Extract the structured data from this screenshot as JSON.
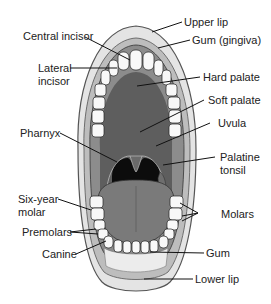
{
  "labels": {
    "upper_lip": "Upper lip",
    "gum_gingiva": "Gum (gingiva)",
    "central_incisor": "Central incisor",
    "lateral_incisor_1": "Lateral",
    "lateral_incisor_2": "incisor",
    "hard_palate": "Hard palate",
    "soft_palate": "Soft palate",
    "pharynx": "Pharnyx",
    "uvula": "Uvula",
    "palatine_tonsil_1": "Palatine",
    "palatine_tonsil_2": "tonsil",
    "six_year_molar_1": "Six-year",
    "six_year_molar_2": "molar",
    "molars": "Molars",
    "premolars": "Premolars",
    "canine": "Canine",
    "gum": "Gum",
    "lower_lip": "Lower lip"
  },
  "colors": {
    "lip": "#e4e4e4",
    "lip_outline": "#555555",
    "gum": "#8c8c8c",
    "palate": "#5e5e5e",
    "throat": "#0c0c0c",
    "tongue": "#7a7a7a",
    "tooth": "#f8f8f8",
    "leader_line": "#111111"
  }
}
